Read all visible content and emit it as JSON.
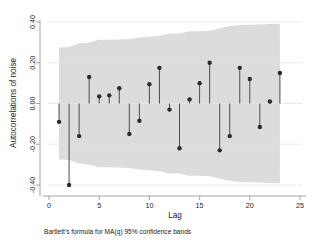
{
  "chart_data": {
    "type": "scatter",
    "title": "",
    "subtitle": "",
    "xlabel": "Lag",
    "ylabel": "Autocorrelations of noise",
    "note": "Bartlett's formula for MA(q) 95% confidence bands",
    "grid": true,
    "legend": "none",
    "xlim": [
      -0.2,
      25.6
    ],
    "ylim": [
      -0.44,
      0.42
    ],
    "xticks": [
      0,
      5,
      10,
      15,
      20,
      25
    ],
    "xtick_labels": [
      "0",
      "5",
      "10",
      "15",
      "20",
      "25"
    ],
    "yticks": [
      0.4,
      0.2,
      0.0,
      -0.2,
      -0.4
    ],
    "ytick_labels": [
      "0.40",
      "0.20",
      "0.00",
      "-0.20",
      "-0.40"
    ],
    "x": [
      1,
      2,
      3,
      4,
      5,
      6,
      7,
      8,
      9,
      10,
      11,
      12,
      13,
      14,
      15,
      16,
      17,
      18,
      19,
      20,
      21,
      22,
      23
    ],
    "values": [
      -0.09,
      -0.4,
      -0.16,
      0.13,
      0.035,
      0.04,
      0.075,
      -0.15,
      -0.085,
      0.095,
      0.175,
      -0.03,
      -0.22,
      0.02,
      0.1,
      0.2,
      -0.23,
      -0.16,
      0.175,
      0.12,
      -0.115,
      0.01,
      0.15
    ],
    "series": [
      {
        "name": "Autocorrelations of noise",
        "values": [
          -0.09,
          -0.4,
          -0.16,
          0.13,
          0.035,
          0.04,
          0.075,
          -0.15,
          -0.085,
          0.095,
          0.175,
          -0.03,
          -0.22,
          0.02,
          0.1,
          0.2,
          -0.23,
          -0.16,
          0.175,
          0.12,
          -0.115,
          0.01,
          0.15
        ]
      }
    ],
    "confidence_band": {
      "label": "Bartlett's formula for MA(q) 95% confidence bands",
      "level": "95%",
      "upper": [
        0.275,
        0.277,
        0.295,
        0.3,
        0.313,
        0.313,
        0.314,
        0.316,
        0.324,
        0.327,
        0.333,
        0.344,
        0.344,
        0.355,
        0.355,
        0.357,
        0.368,
        0.38,
        0.385,
        0.386,
        0.388,
        0.39,
        0.392
      ],
      "lower": [
        -0.275,
        -0.277,
        -0.295,
        -0.3,
        -0.313,
        -0.313,
        -0.314,
        -0.316,
        -0.324,
        -0.327,
        -0.333,
        -0.344,
        -0.344,
        -0.355,
        -0.355,
        -0.357,
        -0.368,
        -0.38,
        -0.385,
        -0.386,
        -0.388,
        -0.39,
        -0.392
      ],
      "color": "#dcdcdc"
    },
    "marker_color": "#2b2b2b",
    "stem_color": "#3a3a3a",
    "axis_color": "#9a9a9a",
    "grid_color": "#e4e4e4"
  }
}
